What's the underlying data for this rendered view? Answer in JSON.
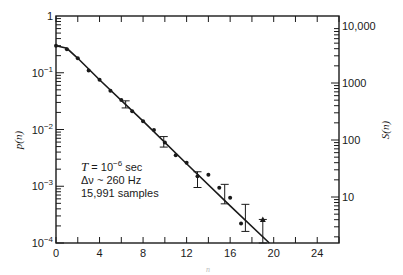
{
  "chart_data": {
    "type": "scatter",
    "title": "",
    "xlabel": "n",
    "ylabel": "p(n)",
    "ylabel_right": "S(n)",
    "xlim": [
      0,
      26
    ],
    "ylim": [
      0.0001,
      1
    ],
    "yscale": "log",
    "x_ticks": [
      0,
      4,
      8,
      12,
      16,
      20,
      24
    ],
    "y_ticks": [
      "10^-4",
      "10^-3",
      "10^-2",
      "10^-1",
      "1"
    ],
    "right_ticks": [
      "10",
      "100",
      "1000",
      "10,000"
    ],
    "grid": false,
    "legend": null,
    "annotation": {
      "line1": "T = 10",
      "line1_exp": "−6",
      "line1_unit": " sec",
      "line2": "Δν ~ 260 Hz",
      "line3": "15,991 samples"
    },
    "series": [
      {
        "name": "measured p(n)",
        "points": [
          {
            "n": 0,
            "p": 0.3
          },
          {
            "n": 1,
            "p": 0.26
          },
          {
            "n": 2,
            "p": 0.18
          },
          {
            "n": 3,
            "p": 0.11
          },
          {
            "n": 4,
            "p": 0.075
          },
          {
            "n": 5,
            "p": 0.048
          },
          {
            "n": 6,
            "p": 0.033
          },
          {
            "n": 7,
            "p": 0.021
          },
          {
            "n": 8,
            "p": 0.014
          },
          {
            "n": 9,
            "p": 0.0098
          },
          {
            "n": 10,
            "p": 0.0059
          },
          {
            "n": 11,
            "p": 0.0035
          },
          {
            "n": 12,
            "p": 0.0026
          },
          {
            "n": 13,
            "p": 0.0015
          },
          {
            "n": 14,
            "p": 0.0016
          },
          {
            "n": 15,
            "p": 0.00094
          },
          {
            "n": 16,
            "p": 0.00063
          },
          {
            "n": 17,
            "p": 0.00022
          },
          {
            "n": 19,
            "p": 0.00026
          }
        ]
      },
      {
        "name": "error bars",
        "bars": [
          {
            "n": 6.4,
            "p": 0.028,
            "low": 0.024,
            "high": 0.032
          },
          {
            "n": 9.9,
            "p": 0.0062,
            "low": 0.0049,
            "high": 0.0075
          },
          {
            "n": 13.0,
            "p": 0.0013,
            "low": 0.00095,
            "high": 0.0018
          },
          {
            "n": 15.5,
            "p": 0.00073,
            "low": 0.00049,
            "high": 0.00108
          },
          {
            "n": 17.4,
            "p": 0.00027,
            "low": 0.00016,
            "high": 0.00048
          },
          {
            "n": 19.0,
            "p": 0.00026,
            "low": 0.0001,
            "high": 0.00026
          }
        ]
      },
      {
        "name": "theoretical curve",
        "curve": [
          {
            "n": 0,
            "p": 0.3
          },
          {
            "n": 1,
            "p": 0.27
          },
          {
            "n": 2,
            "p": 0.18
          },
          {
            "n": 4,
            "p": 0.075
          },
          {
            "n": 8,
            "p": 0.014
          },
          {
            "n": 12,
            "p": 0.0025
          },
          {
            "n": 16,
            "p": 0.00045
          },
          {
            "n": 19.6,
            "p": 0.0001
          }
        ]
      }
    ]
  }
}
